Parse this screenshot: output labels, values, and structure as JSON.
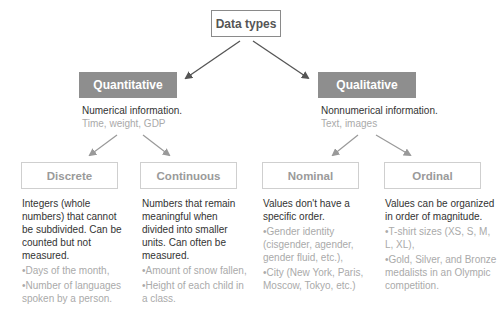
{
  "root": {
    "label": "Data types"
  },
  "categories": [
    {
      "label": "Quantitative",
      "description": "Numerical information.",
      "examples": "Time, weight, GDP",
      "children": [
        {
          "label": "Discrete",
          "description": "Integers (whole numbers) that cannot be subdivided. Can be counted but not measured.",
          "bullets": [
            "•Days of the month,",
            "•Number of languages spoken by a person."
          ]
        },
        {
          "label": "Continuous",
          "description": "Numbers that remain meaningful when divided into smaller units. Can often be measured.",
          "bullets": [
            "•Amount of snow fallen,",
            "•Height of each child in a class."
          ]
        }
      ]
    },
    {
      "label": "Qualitative",
      "description": "Nonnumerical information.",
      "examples": "Text, images",
      "children": [
        {
          "label": "Nominal",
          "description": "Values don't have a specific order.",
          "bullets": [
            "•Gender identity (cisgender, agender, gender fluid, etc.),",
            "•City (New York, Paris, Moscow, Tokyo, etc.)"
          ]
        },
        {
          "label": "Ordinal",
          "description": "Values can be organized in order of magnitude.",
          "bullets": [
            "•T-shirt sizes (XS, S, M, L, XL),",
            "•Gold, Silver, and Bronze medalists in an Olympic competition."
          ]
        }
      ]
    }
  ],
  "colors": {
    "category_fill": "#8e8e8e",
    "root_border": "#8a8a8a",
    "leaf_border": "#cfcfcf",
    "top_arrow": "#555555",
    "lower_arrow": "#999999"
  }
}
